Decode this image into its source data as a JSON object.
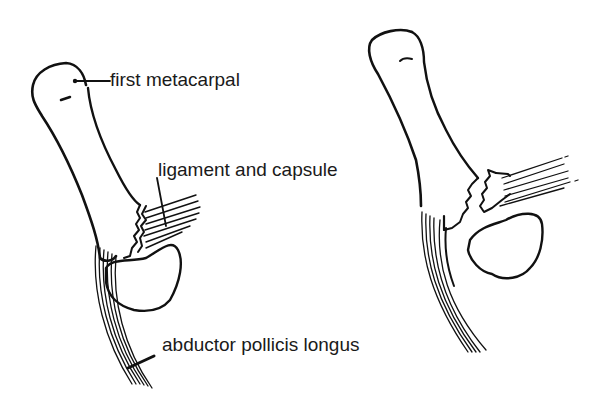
{
  "diagram": {
    "type": "anatomical line drawing",
    "panels": [
      {
        "id": "left",
        "description": "Intact thumb CMC joint with labeled structures",
        "labels": {
          "first_metacarpal": "first metacarpal",
          "ligament_and_capsule": "ligament and capsule",
          "abductor_pollicis_longus": "abductor pollicis longus"
        }
      },
      {
        "id": "right",
        "description": "Bennett-type fracture dislocation: ligament avulsion fragment separated from metacarpal base, metacarpal displaced by abductor pollicis longus pull"
      }
    ],
    "colors": {
      "line": "#111111",
      "background": "#ffffff",
      "text": "#1a1a1a"
    }
  }
}
